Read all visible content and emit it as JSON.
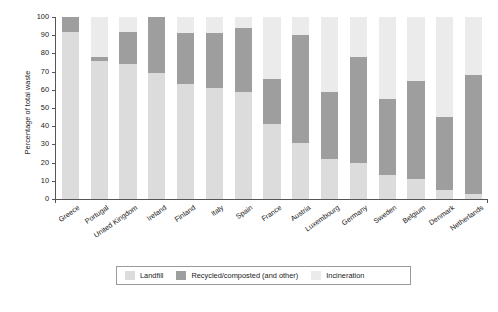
{
  "chart_data": {
    "type": "bar",
    "subtype": "stacked-bar-100-percent",
    "title": "",
    "xlabel": "",
    "ylabel": "Percentage of total waste",
    "ylim": [
      0,
      100
    ],
    "yticks": [
      0,
      10,
      20,
      30,
      40,
      50,
      60,
      70,
      80,
      90,
      100
    ],
    "grid": false,
    "legend_position": "bottom",
    "categories": [
      "Greece",
      "Portugal",
      "United Kingdom",
      "Ireland",
      "Finland",
      "Italy",
      "Spain",
      "France",
      "Austria",
      "Luxembourg",
      "Germany",
      "Sweden",
      "Belgium",
      "Denmark",
      "Netherlands"
    ],
    "series": [
      {
        "name": "Landfill",
        "color": "#dcdcdc",
        "values": [
          92,
          76,
          74,
          69,
          63,
          61,
          59,
          41,
          31,
          22,
          20,
          13,
          11,
          5,
          3
        ]
      },
      {
        "name": "Recycled/composted (and other)",
        "color": "#9e9e9e",
        "values": [
          8,
          2,
          18,
          31,
          28,
          30,
          35,
          25,
          59,
          37,
          58,
          42,
          54,
          40,
          65
        ]
      },
      {
        "name": "Incineration",
        "color": "#ebebeb",
        "values": [
          0,
          22,
          8,
          0,
          9,
          9,
          6,
          34,
          10,
          41,
          22,
          45,
          35,
          55,
          32
        ]
      }
    ]
  },
  "axes": {
    "y_title": "Percentage of total waste",
    "y_tick_labels": [
      "0",
      "10",
      "20",
      "30",
      "40",
      "50",
      "60",
      "70",
      "80",
      "90",
      "100"
    ]
  },
  "legend": {
    "items": [
      {
        "label": "Landfill",
        "color": "#dcdcdc"
      },
      {
        "label": "Recycled/composted (and other)",
        "color": "#9e9e9e"
      },
      {
        "label": "Incineration",
        "color": "#ebebeb"
      }
    ]
  },
  "caption": {
    "text": ""
  }
}
